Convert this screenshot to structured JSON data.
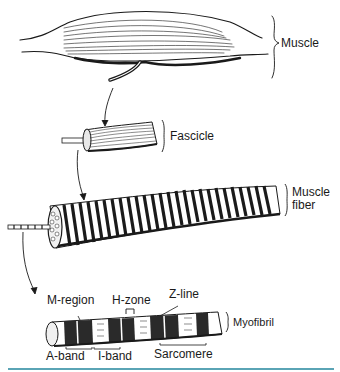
{
  "diagram": {
    "type": "hierarchical anatomy illustration",
    "levels": [
      {
        "id": "muscle",
        "label": "Muscle"
      },
      {
        "id": "fascicle",
        "label": "Fascicle"
      },
      {
        "id": "fiber",
        "label_line1": "Muscle",
        "label_line2": "fiber"
      },
      {
        "id": "myofibril",
        "label": "Myofibril"
      }
    ],
    "myofibril_parts": {
      "m_region": "M-region",
      "h_zone": "H-zone",
      "z_line": "Z-line",
      "a_band": "A-band",
      "i_band": "I-band",
      "sarcomere": "Sarcomere"
    },
    "colors": {
      "ink": "#1a1a1a",
      "rule": "#5aa4b5"
    }
  }
}
